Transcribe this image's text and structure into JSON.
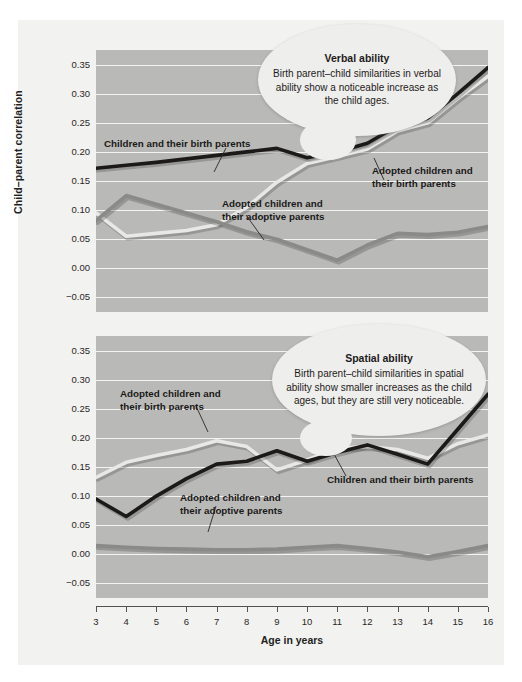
{
  "figure": {
    "y_axis_label": "Child–parent correlation",
    "x_axis_label": "Age in years",
    "background_color": "#f2f2f0",
    "plot_background_color": "#b9b9b7",
    "gridline_color": "#f4f4f2"
  },
  "series_colors": {
    "children_birth_parents": "#1c1a19",
    "adopted_birth_parents": "#e8e8e6",
    "adopted_adoptive_parents": "#8a8a88"
  },
  "callouts": {
    "verbal": {
      "title": "Verbal ability",
      "body": "Birth parent–child similarities in verbal ability show a noticeable increase as the child ages."
    },
    "spatial": {
      "title": "Spatial ability",
      "body": "Birth parent–child similarities in spatial ability show smaller increases as the child ages, but they are still very noticeable."
    }
  },
  "annotations": {
    "verbal": [
      {
        "text": "Children and their birth parents"
      },
      {
        "text_line1": "Adopted children and",
        "text_line2": "their adoptive parents"
      },
      {
        "text_line1": "Adopted children and",
        "text_line2": "their birth parents"
      }
    ],
    "spatial": [
      {
        "text_line1": "Adopted children and",
        "text_line2": "their birth parents"
      },
      {
        "text_line1": "Adopted children and",
        "text_line2": "their adoptive parents"
      },
      {
        "text": "Children and their birth parents"
      }
    ]
  },
  "chart_data": [
    {
      "type": "line",
      "title": "Verbal ability",
      "xlabel": "Age in years",
      "ylabel": "Child–parent correlation",
      "x": [
        3,
        4,
        5,
        6,
        7,
        8,
        9,
        10,
        11,
        12,
        13,
        14,
        15,
        16
      ],
      "xlim": [
        3,
        16
      ],
      "ylim": [
        -0.075,
        0.375
      ],
      "yticks": [
        -0.05,
        0.0,
        0.05,
        0.1,
        0.15,
        0.2,
        0.25,
        0.3,
        0.35
      ],
      "ytick_labels": [
        "−0.05",
        "0.00",
        "0.05",
        "0.10",
        "0.15",
        "0.20",
        "0.25",
        "0.30",
        "0.35"
      ],
      "xticks": [
        3,
        4,
        5,
        6,
        7,
        8,
        9,
        10,
        11,
        12,
        13,
        14,
        15,
        16
      ],
      "grid": true,
      "legend_position": "inline-annotations",
      "series": [
        {
          "name": "Children and their birth parents",
          "color": "#1c1a19",
          "values": [
            0.172,
            0.177,
            0.182,
            0.188,
            0.194,
            0.2,
            0.206,
            0.19,
            0.2,
            0.215,
            0.245,
            0.258,
            0.3,
            0.345
          ]
        },
        {
          "name": "Adopted children and their birth parents",
          "color": "#e8e8e6",
          "values": [
            0.095,
            0.055,
            0.06,
            0.065,
            0.075,
            0.105,
            0.148,
            0.18,
            0.192,
            0.205,
            0.236,
            0.25,
            0.292,
            0.33
          ]
        },
        {
          "name": "Adopted children and their adoptive parents",
          "color": "#8a8a88",
          "values": [
            0.082,
            0.125,
            0.11,
            0.095,
            0.08,
            0.063,
            0.05,
            0.032,
            0.014,
            0.04,
            0.06,
            0.058,
            0.062,
            0.072
          ]
        }
      ]
    },
    {
      "type": "line",
      "title": "Spatial ability",
      "xlabel": "Age in years",
      "ylabel": "Child–parent correlation",
      "x": [
        3,
        4,
        5,
        6,
        7,
        8,
        9,
        10,
        11,
        12,
        13,
        14,
        15,
        16
      ],
      "xlim": [
        3,
        16
      ],
      "ylim": [
        -0.075,
        0.375
      ],
      "yticks": [
        -0.05,
        0.0,
        0.05,
        0.1,
        0.15,
        0.2,
        0.25,
        0.3,
        0.35
      ],
      "ytick_labels": [
        "−0.05",
        "0.00",
        "0.05",
        "0.10",
        "0.15",
        "0.20",
        "0.25",
        "0.30",
        "0.35"
      ],
      "xticks": [
        3,
        4,
        5,
        6,
        7,
        8,
        9,
        10,
        11,
        12,
        13,
        14,
        15,
        16
      ],
      "grid": true,
      "legend_position": "inline-annotations",
      "series": [
        {
          "name": "Children and their birth parents",
          "color": "#1c1a19",
          "values": [
            0.095,
            0.065,
            0.1,
            0.13,
            0.155,
            0.16,
            0.178,
            0.16,
            0.175,
            0.188,
            0.172,
            0.155,
            0.215,
            0.275
          ]
        },
        {
          "name": "Adopted children and their birth parents",
          "color": "#e8e8e6",
          "values": [
            0.132,
            0.158,
            0.17,
            0.18,
            0.195,
            0.185,
            0.145,
            0.162,
            0.182,
            0.185,
            0.18,
            0.165,
            0.19,
            0.205
          ]
        },
        {
          "name": "Adopted children and their adoptive parents",
          "color": "#8a8a88",
          "values": [
            0.015,
            0.012,
            0.01,
            0.009,
            0.008,
            0.008,
            0.009,
            0.012,
            0.015,
            0.01,
            0.004,
            -0.004,
            0.005,
            0.015
          ]
        }
      ]
    }
  ]
}
